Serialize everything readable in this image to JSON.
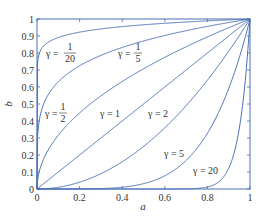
{
  "chart_data": {
    "type": "line",
    "title": "",
    "xlabel": "a",
    "ylabel": "b",
    "xlim": [
      0,
      1
    ],
    "ylim": [
      0,
      1
    ],
    "grid": false,
    "legend": "none (inline curve labels)",
    "function": "b = a^gamma",
    "x_ticks": [
      "0",
      "0.2",
      "0.4",
      "0.6",
      "0.8",
      "1"
    ],
    "y_ticks": [
      "0",
      "0.1",
      "0.2",
      "0.3",
      "0.4",
      "0.5",
      "0.6",
      "0.7",
      "0.8",
      "0.9",
      "1"
    ],
    "series": [
      {
        "name": "γ = 1/20",
        "gamma": 0.05,
        "label_lhs": "γ =",
        "label_num": "1",
        "label_den": "20"
      },
      {
        "name": "γ = 1/5",
        "gamma": 0.2,
        "label_lhs": "γ =",
        "label_num": "1",
        "label_den": "5"
      },
      {
        "name": "γ = 1/2",
        "gamma": 0.5,
        "label_lhs": "γ =",
        "label_num": "1",
        "label_den": "2"
      },
      {
        "name": "γ = 1",
        "gamma": 1,
        "label": "γ = 1"
      },
      {
        "name": "γ = 2",
        "gamma": 2,
        "label": "γ = 2"
      },
      {
        "name": "γ = 5",
        "gamma": 5,
        "label": "γ = 5"
      },
      {
        "name": "γ = 20",
        "gamma": 20,
        "label": "γ = 20"
      }
    ],
    "line_color": "#4a6fb5"
  }
}
